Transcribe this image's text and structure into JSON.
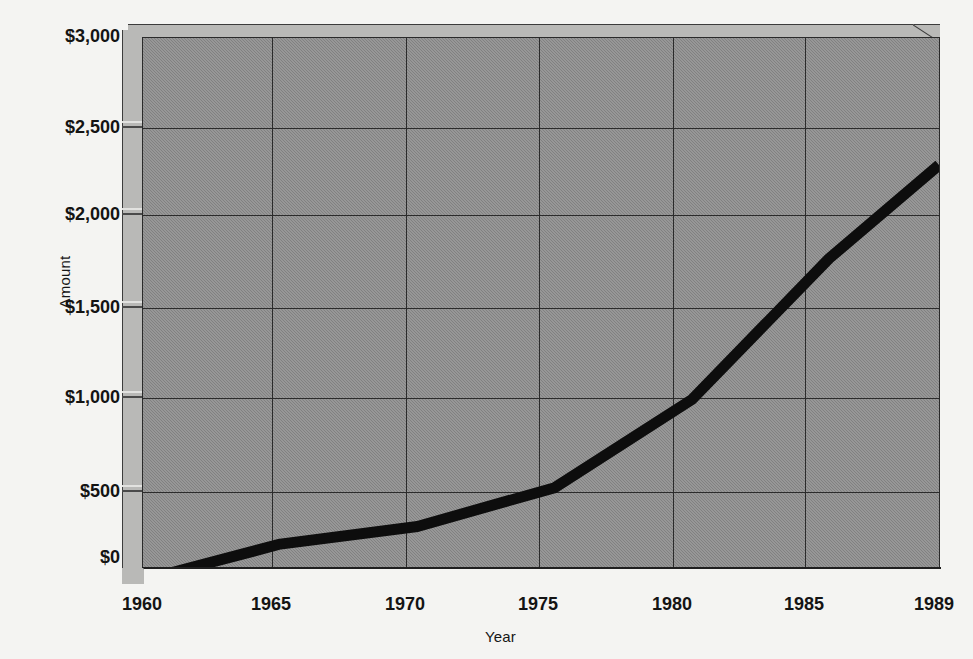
{
  "chart_data": {
    "type": "line",
    "title": "",
    "subtitle": "",
    "xlabel": "Year",
    "ylabel": "Amount",
    "grid": true,
    "legend": false,
    "legend_position": "none",
    "xlim": [
      1960,
      1989
    ],
    "ylim": [
      0,
      3000
    ],
    "x_ticks": [
      1960,
      1965,
      1970,
      1975,
      1980,
      1985,
      1989
    ],
    "x_tick_labels": [
      "1960",
      "1965",
      "1970",
      "1975",
      "1980",
      "1985",
      "1989"
    ],
    "y_ticks": [
      0,
      500,
      1000,
      1500,
      2000,
      2500,
      3000
    ],
    "y_tick_labels": [
      "$0",
      "$500",
      "$1,000",
      "$1,500",
      "$2,000",
      "$2,500",
      "$3,000"
    ],
    "x": [
      1960,
      1965,
      1970,
      1975,
      1980,
      1985,
      1989
    ],
    "values": [
      -75,
      130,
      230,
      450,
      950,
      1750,
      2280
    ],
    "series": [
      {
        "name": "Amount",
        "x": [
          1960,
          1965,
          1970,
          1975,
          1980,
          1985,
          1989
        ],
        "values": [
          -75,
          130,
          230,
          450,
          950,
          1750,
          2280
        ],
        "color": "#0d0d0d",
        "line_width": 11
      }
    ],
    "annotations": []
  },
  "axes": {
    "y_title": "Amount",
    "x_title": "Year",
    "y_tick_labels": [
      "$3,000",
      "$2,500",
      "$2,000",
      "$1,500",
      "$1,000",
      "$500",
      "$0"
    ],
    "x_tick_labels": [
      "1960",
      "1965",
      "1970",
      "1975",
      "1980",
      "1985",
      "1989"
    ]
  },
  "style": {
    "plot_fill": "#8b8b8b",
    "wall_fill": "#b9b9b7",
    "page_background": "#f4f4f2",
    "gridline_color": "#2b2b2b",
    "series_color": "#0d0d0d",
    "text_color": "#141414"
  }
}
